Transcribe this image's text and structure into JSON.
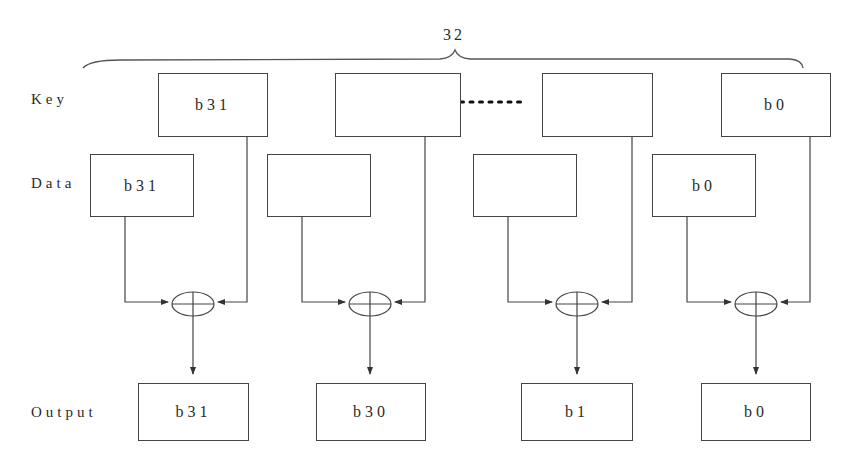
{
  "diagram": {
    "width_label": "32",
    "row_labels": {
      "key": "Key",
      "data": "Data",
      "output": "Output"
    },
    "ellipsis": "........",
    "key_boxes": [
      "b31",
      "",
      "",
      "b0"
    ],
    "data_boxes": [
      "b31",
      "",
      "",
      "b0"
    ],
    "output_boxes": [
      "b31",
      "b30",
      "b1",
      "b0"
    ],
    "operator": "xor",
    "line_color": "#444444"
  }
}
